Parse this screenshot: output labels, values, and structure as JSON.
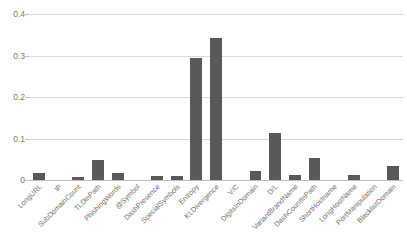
{
  "chart_data": {
    "type": "bar",
    "title": "",
    "subtitle": "",
    "xlabel": "",
    "ylabel": "",
    "ylim": [
      0,
      0.4
    ],
    "grid": true,
    "legend": false,
    "y_ticks": [
      "0.4",
      "0.3",
      "0.2",
      "0.1",
      "0"
    ],
    "y_tick_values": [
      0.4,
      0.3,
      0.2,
      0.1,
      0
    ],
    "bar_color": "#595959",
    "gridline_color": "#d9d9d9",
    "categories": [
      "LongURL",
      "IP",
      "SubDomainCount",
      "TLDinPath",
      "PhishingWords",
      "@Symbol",
      "DashPresence",
      "SpecialSymbols",
      "Entropy",
      "KLDivergence",
      "V/C",
      "DigitsInDomain",
      "D/L",
      "VariantBrandName",
      "DashCountInPath",
      "ShortHostname",
      "LongHostName",
      "PortManipulation",
      "BlacklistDomain"
    ],
    "values": [
      0.017,
      0.0,
      0.007,
      0.049,
      0.018,
      0.0,
      0.009,
      0.009,
      0.294,
      0.342,
      0.0,
      0.021,
      0.113,
      0.011,
      0.054,
      0.0,
      0.011,
      0.0,
      0.033
    ]
  }
}
